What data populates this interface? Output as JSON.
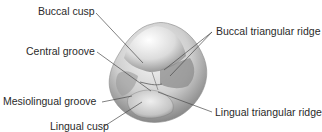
{
  "diagram": {
    "labels": [
      {
        "id": "buccal-cusp",
        "text": "Buccal cusp"
      },
      {
        "id": "central-groove",
        "text": "Central groove"
      },
      {
        "id": "mesiolingual-groove",
        "text": "Mesiolingual groove"
      },
      {
        "id": "lingual-cusp",
        "text": "Lingual cusp"
      },
      {
        "id": "buccal-triangular-ridge",
        "text": "Buccal triangular ridge"
      },
      {
        "id": "lingual-triangular-ridge",
        "text": "Lingual triangular ridge"
      }
    ],
    "colors": {
      "leader_line": "#4a4a4a",
      "text": "#2a2a2a",
      "tooth_light": "#f2f2f2",
      "tooth_mid": "#b8b8b8",
      "tooth_dark": "#6a6a6a"
    }
  }
}
